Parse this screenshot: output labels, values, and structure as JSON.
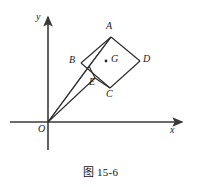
{
  "figure": {
    "caption": "图 15-6",
    "axes": {
      "x_label": "x",
      "y_label": "y",
      "origin_label": "O",
      "x_axis": {
        "x1": 10,
        "y1": 122,
        "x2": 186,
        "y2": 122
      },
      "y_axis": {
        "x1": 48,
        "y1": 150,
        "x2": 48,
        "y2": 13
      }
    },
    "points": {
      "A": {
        "x": 111,
        "y": 37,
        "label": "A",
        "label_x": 106,
        "label_y": 23
      },
      "B": {
        "x": 89,
        "y": 66,
        "label": "B",
        "label_x": 72,
        "label_y": 56
      },
      "C": {
        "x": 110,
        "y": 88,
        "label": "C",
        "label_x": 106,
        "label_y": 90
      },
      "D": {
        "x": 140,
        "y": 61,
        "label": "D",
        "label_x": 143,
        "label_y": 55
      },
      "E": {
        "x": 95,
        "y": 78,
        "label": "E",
        "label_x": 92,
        "label_y": 78
      },
      "G": {
        "x": 106,
        "y": 61,
        "label": "G",
        "label_x": 111,
        "label_y": 55
      },
      "O": {
        "x": 48,
        "y": 122,
        "label": "O",
        "label_x": 39,
        "label_y": 124
      },
      "square_left": {
        "x": 81,
        "y": 63
      }
    },
    "segments": [
      {
        "name": "square-side-A-D",
        "from": "A",
        "to": "D"
      },
      {
        "name": "square-side-D-C",
        "from": "D",
        "to": "C"
      },
      {
        "name": "square-side-C-left",
        "from": "C",
        "to": "square_left"
      },
      {
        "name": "square-side-left-A",
        "from": "square_left",
        "to": "A"
      },
      {
        "name": "segment-A-B",
        "from": "A",
        "to": "B"
      },
      {
        "name": "segment-B-E",
        "from": "B",
        "to": "E"
      },
      {
        "name": "segment-E-C",
        "from": "E",
        "to": "C"
      },
      {
        "name": "segment-O-A",
        "from": "O",
        "to": "A"
      },
      {
        "name": "segment-O-B",
        "from": "O",
        "to": "B"
      },
      {
        "name": "segment-O-E",
        "from": "O",
        "to": "E"
      }
    ],
    "colors": {
      "stroke": "#2b2b2b",
      "axis": "#3a3a3a",
      "text": "#111111",
      "background": "#ffffff"
    }
  }
}
